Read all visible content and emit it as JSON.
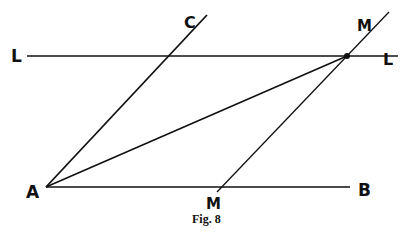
{
  "figure": {
    "caption": "Fig. 8",
    "colors": {
      "ink": "#111111",
      "background": "#ffffff"
    },
    "points": {
      "A": {
        "label": "A"
      },
      "B": {
        "label": "B"
      },
      "C": {
        "label": "C"
      },
      "L_left": {
        "label": "L"
      },
      "L_right": {
        "label": "L"
      },
      "M_top": {
        "label": "M"
      },
      "M_bottom": {
        "label": "M"
      }
    },
    "lines": [
      {
        "name": "line-LL",
        "from": "L",
        "to": "L",
        "description": "horizontal line parallel to AB"
      },
      {
        "name": "line-AC",
        "from": "A",
        "to": "C"
      },
      {
        "name": "line-AB",
        "from": "A",
        "to": "B"
      },
      {
        "name": "line-MM",
        "from": "M",
        "to": "M",
        "description": "parallel to AC, meets LL at marked point"
      },
      {
        "name": "line-A-to-intersection",
        "from": "A",
        "to": "intersection of LL and MM"
      }
    ]
  }
}
